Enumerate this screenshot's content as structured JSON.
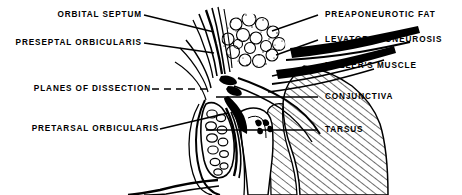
{
  "figure": {
    "style": "black and white line drawing",
    "background_color": "#ffffff",
    "ink_color": "#000000",
    "width": 462,
    "height": 195
  },
  "labels": {
    "orbital_septum": "ORBITAL SEPTUM",
    "preseptal_orbicularis": "PRESEPTAL ORBICULARIS",
    "planes_of_dissection": "PLANES OF DISSECTION",
    "pretarsal_orbicularis": "PRETARSAL ORBICULARIS",
    "preaponeurotic_fat": "PREAPONEUROTIC FAT",
    "levator_aponeurosis": "LEVATOR APONEUROSIS",
    "mullers_muscle": "MULLER'S MUSCLE",
    "conjunctiva": "CONJUNCTIVA",
    "tarsus": "TARSUS"
  },
  "leader_lines": {
    "orbital_septum": "solid",
    "preseptal_orbicularis": "solid",
    "planes_of_dissection": "dashed",
    "pretarsal_orbicularis": "solid",
    "preaponeurotic_fat": "solid",
    "levator_aponeurosis": "solid",
    "mullers_muscle": "solid",
    "conjunctiva": "solid",
    "tarsus": "solid"
  },
  "structures": [
    "skin and preseptal orbicularis fibers",
    "orbital septum",
    "preaponeurotic fat pad",
    "levator aponeurosis",
    "Muller's muscle",
    "conjunctiva",
    "tarsus",
    "pretarsal orbicularis",
    "eyelash line"
  ]
}
